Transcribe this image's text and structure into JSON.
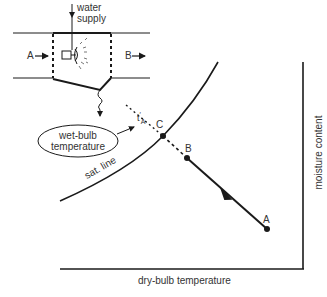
{
  "diagram": {
    "title": "",
    "apparatus": {
      "water_supply_label_line1": "water",
      "water_supply_label_line2": "supply",
      "inlet_label": "A",
      "outlet_label": "B"
    },
    "wet_bulb_bubble": {
      "line1": "wet-bulb",
      "line2": "temperature"
    },
    "wet_bulb_marker": {
      "symbol": "t",
      "prime": "′",
      "subscript": "A"
    },
    "chart": {
      "x_axis_label": "dry-bulb temperature",
      "y_axis_label": "moisture content",
      "curve_label": "sat. line",
      "points": [
        {
          "name": "A",
          "x": 267,
          "y": 229
        },
        {
          "name": "B",
          "x": 187,
          "y": 158
        },
        {
          "name": "C",
          "x": 163,
          "y": 136
        }
      ]
    },
    "colors": {
      "line": "#1a1a1a",
      "text": "#333333",
      "background": "#ffffff"
    }
  }
}
